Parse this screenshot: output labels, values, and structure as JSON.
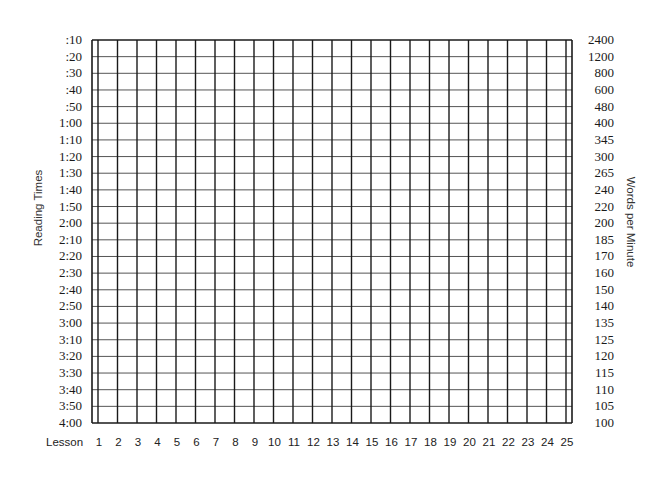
{
  "chart_data": {
    "type": "line",
    "title": "",
    "xlabel": "Lesson",
    "ylabel": "Reading Times",
    "ylabel_right": "Words per Minute",
    "categories": [
      "1",
      "2",
      "3",
      "4",
      "5",
      "6",
      "7",
      "8",
      "9",
      "10",
      "11",
      "12",
      "13",
      "14",
      "15",
      "16",
      "17",
      "18",
      "19",
      "20",
      "21",
      "22",
      "23",
      "24",
      "25"
    ],
    "y_ticks_left": [
      ":10",
      ":20",
      ":30",
      ":40",
      ":50",
      "1:00",
      "1:10",
      "1:20",
      "1:30",
      "1:40",
      "1:50",
      "2:00",
      "2:10",
      "2:20",
      "2:30",
      "2:40",
      "2:50",
      "3:00",
      "3:10",
      "3:20",
      "3:30",
      "3:40",
      "3:50",
      "4:00"
    ],
    "y_ticks_right": [
      "2400",
      "1200",
      "800",
      "600",
      "480",
      "400",
      "345",
      "300",
      "265",
      "240",
      "220",
      "200",
      "185",
      "170",
      "160",
      "150",
      "140",
      "135",
      "125",
      "120",
      "115",
      "110",
      "105",
      "100"
    ],
    "series": [],
    "grid": true,
    "legend": "none"
  },
  "axes": {
    "x_title": "Lesson",
    "left_title": "Reading Times",
    "right_title": "Words per Minute"
  },
  "colors": {
    "vertical_line": "#1a1a1a",
    "horizontal_line": "#555555",
    "border": "#1a1a1a",
    "text": "#1a1a1a"
  }
}
